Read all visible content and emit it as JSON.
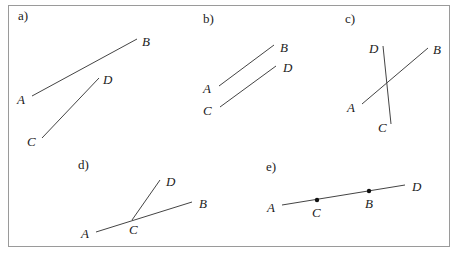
{
  "diagram": {
    "panels": [
      {
        "id": "a",
        "label": "a)",
        "label_pos": [
          18,
          20
        ],
        "segments": [
          {
            "name": "AB",
            "from": [
              32,
              96
            ],
            "to": [
              137,
              39
            ]
          },
          {
            "name": "CD",
            "from": [
              42,
              138
            ],
            "to": [
              99,
              78
            ]
          }
        ],
        "points": [
          {
            "name": "A",
            "pos": [
              17,
              104
            ]
          },
          {
            "name": "B",
            "pos": [
              142,
              46
            ]
          },
          {
            "name": "C",
            "pos": [
              27,
              146
            ]
          },
          {
            "name": "D",
            "pos": [
              103,
              84
            ]
          }
        ],
        "dots": []
      },
      {
        "id": "b",
        "label": "b)",
        "label_pos": [
          203,
          23
        ],
        "segments": [
          {
            "name": "AB",
            "from": [
              219,
              86
            ],
            "to": [
              274,
              45
            ]
          },
          {
            "name": "CD",
            "from": [
              220,
              107
            ],
            "to": [
              276,
              66
            ]
          }
        ],
        "points": [
          {
            "name": "A",
            "pos": [
              203,
              93
            ]
          },
          {
            "name": "B",
            "pos": [
              280,
              52
            ]
          },
          {
            "name": "C",
            "pos": [
              203,
              115
            ]
          },
          {
            "name": "D",
            "pos": [
              283,
              72
            ]
          }
        ],
        "dots": []
      },
      {
        "id": "c",
        "label": "c)",
        "label_pos": [
          345,
          23
        ],
        "segments": [
          {
            "name": "AB",
            "from": [
              362,
              104
            ],
            "to": [
              428,
              48
            ]
          },
          {
            "name": "DC",
            "from": [
              383,
              46
            ],
            "to": [
              391,
              124
            ]
          }
        ],
        "points": [
          {
            "name": "A",
            "pos": [
              347,
              112
            ]
          },
          {
            "name": "B",
            "pos": [
              433,
              54
            ]
          },
          {
            "name": "C",
            "pos": [
              378,
              132
            ]
          },
          {
            "name": "D",
            "pos": [
              369,
              53
            ]
          }
        ],
        "dots": []
      },
      {
        "id": "d",
        "label": "d)",
        "label_pos": [
          78,
          169
        ],
        "segments": [
          {
            "name": "AB",
            "from": [
              96,
              232
            ],
            "to": [
              192,
              202
            ]
          },
          {
            "name": "CD",
            "from": [
              132,
              220
            ],
            "to": [
              160,
              180
            ]
          }
        ],
        "points": [
          {
            "name": "A",
            "pos": [
              81,
              238
            ]
          },
          {
            "name": "B",
            "pos": [
              199,
              208
            ]
          },
          {
            "name": "C",
            "pos": [
              129,
              234
            ]
          },
          {
            "name": "D",
            "pos": [
              166,
              186
            ]
          }
        ],
        "dots": []
      },
      {
        "id": "e",
        "label": "e)",
        "label_pos": [
          266,
          171
        ],
        "segments": [
          {
            "name": "AD",
            "from": [
              282,
              205
            ],
            "to": [
              405,
              185
            ]
          }
        ],
        "points": [
          {
            "name": "A",
            "pos": [
              267,
              212
            ]
          },
          {
            "name": "C",
            "pos": [
              312,
              217
            ]
          },
          {
            "name": "B",
            "pos": [
              365,
              208
            ]
          },
          {
            "name": "D",
            "pos": [
              412,
              191
            ]
          }
        ],
        "dots": [
          {
            "name": "C",
            "pos": [
              317,
              200
            ]
          },
          {
            "name": "B",
            "pos": [
              369,
              191
            ]
          }
        ]
      }
    ]
  }
}
